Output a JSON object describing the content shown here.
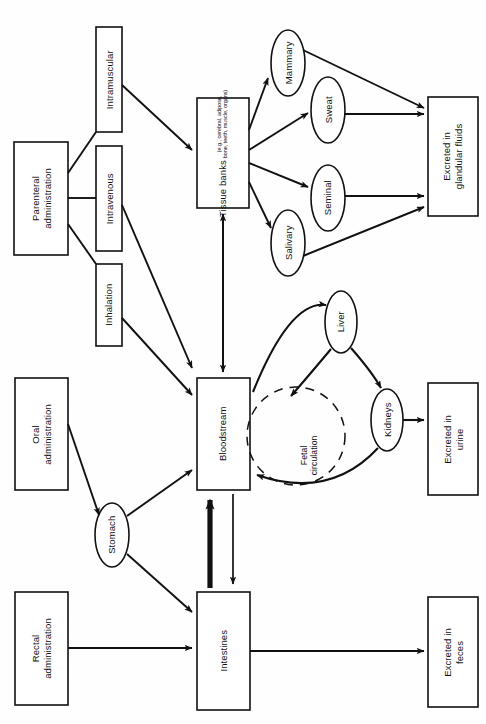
{
  "diagram": {
    "orientation": "rotated-90-ccw",
    "style": {
      "stroke": "#111111",
      "fill": "#ffffff",
      "background": "#fefefe",
      "dashed_stroke": "#111111"
    },
    "nodes": [
      {
        "id": "parenteral",
        "shape": "rect",
        "label": "Parenteral\nadministration",
        "line1": "Parenteral",
        "line2": "administration"
      },
      {
        "id": "intramuscular",
        "shape": "rect",
        "label": "Intramuscular",
        "line1": "Intramuscular",
        "line2": ""
      },
      {
        "id": "intravenous",
        "shape": "rect",
        "label": "Intravenous",
        "line1": "Intravenous",
        "line2": ""
      },
      {
        "id": "inhalation",
        "shape": "rect",
        "label": "Inhalation",
        "line1": "Inhalation",
        "line2": ""
      },
      {
        "id": "tissue-banks",
        "shape": "rect",
        "label": "Tissue banks",
        "line1": "Tissue banks",
        "sub1": "(e.g., cerebral, adipose,",
        "sub2": "bone, teeth, muscle, organs)"
      },
      {
        "id": "mammary",
        "shape": "ellipse",
        "label": "Mammary"
      },
      {
        "id": "sweat",
        "shape": "ellipse",
        "label": "Sweat"
      },
      {
        "id": "seminal",
        "shape": "ellipse",
        "label": "Seminal"
      },
      {
        "id": "salivary",
        "shape": "ellipse",
        "label": "Salivary"
      },
      {
        "id": "excreted-glandular",
        "shape": "rect",
        "label": "Excreted in glandular fluids",
        "line1": "Excreted in",
        "line2": "glandular fluids"
      },
      {
        "id": "bloodstream",
        "shape": "rect",
        "label": "Bloodstream",
        "line1": "Bloodstream",
        "line2": ""
      },
      {
        "id": "liver",
        "shape": "ellipse",
        "label": "Liver"
      },
      {
        "id": "kidneys",
        "shape": "ellipse",
        "label": "Kidneys"
      },
      {
        "id": "fetal-circulation",
        "shape": "dashed-circle",
        "label": "Fetal circulation",
        "line1": "Fetal",
        "line2": "circulation"
      },
      {
        "id": "excreted-urine",
        "shape": "rect",
        "label": "Excreted in urine",
        "line1": "Excreted in",
        "line2": "urine"
      },
      {
        "id": "oral",
        "shape": "rect",
        "label": "Oral administration",
        "line1": "Oral",
        "line2": "administration"
      },
      {
        "id": "stomach",
        "shape": "ellipse",
        "label": "Stomach"
      },
      {
        "id": "rectal",
        "shape": "rect",
        "label": "Rectal administration",
        "line1": "Rectal",
        "line2": "administration"
      },
      {
        "id": "intestines",
        "shape": "rect",
        "label": "Intestines",
        "line1": "Intestines",
        "line2": ""
      },
      {
        "id": "excreted-feces",
        "shape": "rect",
        "label": "Excreted in feces",
        "line1": "Excreted in",
        "line2": "feces"
      }
    ],
    "edges": [
      {
        "from": "parenteral",
        "to": "intramuscular",
        "arrow": false
      },
      {
        "from": "parenteral",
        "to": "intravenous",
        "arrow": false
      },
      {
        "from": "parenteral",
        "to": "inhalation",
        "arrow": false
      },
      {
        "from": "intramuscular",
        "to": "tissue-banks",
        "arrow": true
      },
      {
        "from": "intravenous",
        "to": "bloodstream",
        "arrow": true
      },
      {
        "from": "inhalation",
        "to": "bloodstream",
        "arrow": true
      },
      {
        "from": "bloodstream",
        "to": "tissue-banks",
        "arrow": true,
        "bidirectional": true
      },
      {
        "from": "tissue-banks",
        "to": "mammary",
        "arrow": true
      },
      {
        "from": "tissue-banks",
        "to": "sweat",
        "arrow": true
      },
      {
        "from": "tissue-banks",
        "to": "seminal",
        "arrow": true
      },
      {
        "from": "tissue-banks",
        "to": "salivary",
        "arrow": true
      },
      {
        "from": "mammary",
        "to": "excreted-glandular",
        "arrow": true
      },
      {
        "from": "sweat",
        "to": "excreted-glandular",
        "arrow": true
      },
      {
        "from": "seminal",
        "to": "excreted-glandular",
        "arrow": true
      },
      {
        "from": "salivary",
        "to": "excreted-glandular",
        "arrow": true
      },
      {
        "from": "bloodstream",
        "to": "liver",
        "arrow": true
      },
      {
        "from": "liver",
        "to": "kidneys",
        "arrow": true
      },
      {
        "from": "kidneys",
        "to": "bloodstream",
        "arrow": true
      },
      {
        "from": "liver",
        "to": "bloodstream",
        "arrow": true
      },
      {
        "from": "kidneys",
        "to": "excreted-urine",
        "arrow": true
      },
      {
        "from": "oral",
        "to": "stomach",
        "arrow": true
      },
      {
        "from": "stomach",
        "to": "bloodstream",
        "arrow": true
      },
      {
        "from": "stomach",
        "to": "intestines",
        "arrow": true
      },
      {
        "from": "rectal",
        "to": "intestines",
        "arrow": true
      },
      {
        "from": "intestines",
        "to": "bloodstream",
        "arrow": true,
        "weight": "thick"
      },
      {
        "from": "bloodstream",
        "to": "intestines",
        "arrow": true,
        "weight": "thin"
      },
      {
        "from": "intestines",
        "to": "excreted-feces",
        "arrow": true
      }
    ]
  }
}
